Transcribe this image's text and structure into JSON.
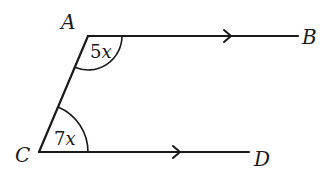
{
  "diagram": {
    "type": "geometry",
    "points": {
      "A": {
        "label": "A"
      },
      "B": {
        "label": "B"
      },
      "C": {
        "label": "C"
      },
      "D": {
        "label": "D"
      }
    },
    "segments": [
      {
        "from": "A",
        "to": "B",
        "parallel_mark": true
      },
      {
        "from": "C",
        "to": "D",
        "parallel_mark": true
      },
      {
        "from": "A",
        "to": "C",
        "parallel_mark": false
      }
    ],
    "angles": {
      "at_A": {
        "coef": "5",
        "var": "x"
      },
      "at_C": {
        "coef": "7",
        "var": "x"
      }
    },
    "colors": {
      "stroke": "#1a1a1a",
      "background": "#ffffff"
    }
  }
}
